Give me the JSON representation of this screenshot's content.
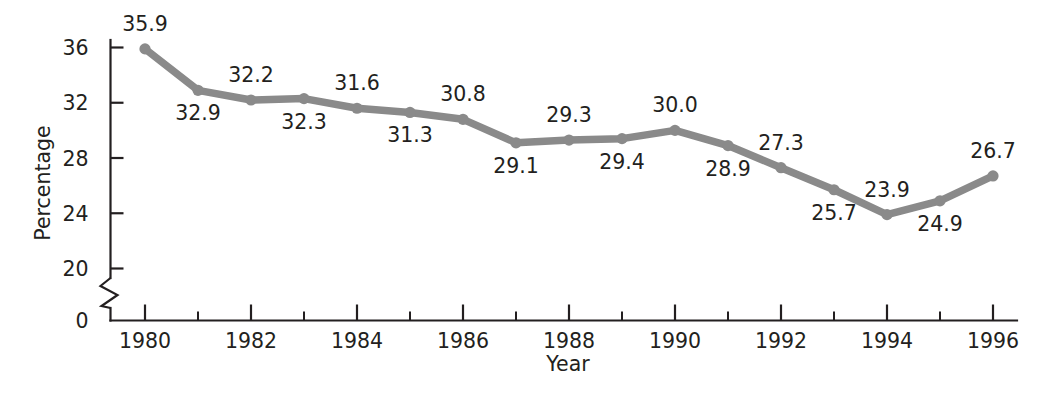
{
  "chart_data": {
    "type": "line",
    "title": "",
    "xlabel": "Year",
    "ylabel": "Percentage",
    "x": [
      1980,
      1981,
      1982,
      1983,
      1984,
      1985,
      1986,
      1987,
      1988,
      1989,
      1990,
      1991,
      1992,
      1993,
      1994,
      1995,
      1996
    ],
    "values": [
      35.9,
      32.9,
      32.2,
      32.3,
      31.6,
      31.3,
      30.8,
      29.1,
      29.3,
      29.4,
      30.0,
      28.9,
      27.3,
      25.7,
      23.9,
      24.9,
      26.7
    ],
    "point_labels": [
      "35.9",
      "32.9",
      "32.2",
      "32.3",
      "31.6",
      "31.3",
      "30.8",
      "29.1",
      "29.3",
      "29.4",
      "30.0",
      "28.9",
      "27.3",
      "25.7",
      "23.9",
      "24.9",
      "26.7"
    ],
    "label_position": [
      "above",
      "below",
      "above",
      "below",
      "above",
      "below",
      "above",
      "below",
      "above",
      "below",
      "above",
      "below",
      "above",
      "below",
      "above",
      "below",
      "above"
    ],
    "xlim": [
      1979.5,
      1996.6
    ],
    "ylim": [
      19.4,
      36.9
    ],
    "x_tick_labels": [
      "1980",
      "1982",
      "1984",
      "1986",
      "1988",
      "1990",
      "1992",
      "1994",
      "1996"
    ],
    "x_tick_values": [
      1980,
      1982,
      1984,
      1986,
      1988,
      1990,
      1992,
      1994,
      1996
    ],
    "x_minor_tick_values": [
      1981,
      1983,
      1985,
      1987,
      1989,
      1991,
      1993,
      1995
    ],
    "y_tick_labels": [
      "36",
      "32",
      "28",
      "24",
      "20",
      "0"
    ],
    "y_tick_values": [
      36,
      32,
      28,
      24,
      20,
      0
    ],
    "y_axis_break": true,
    "grid": false,
    "legend": null,
    "series_color": "#8a8a8a",
    "axis_color": "#231f20",
    "background_color": "#ffffff"
  }
}
